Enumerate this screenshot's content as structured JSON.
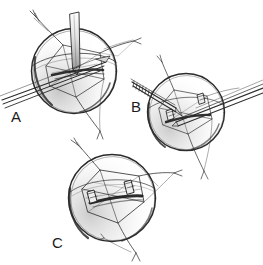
{
  "figure": {
    "kind": "ink-line-drawing",
    "background_color": "#ffffff",
    "ink_color": "#2b2b2b",
    "shade_color": "#8d8d8d",
    "width": 263,
    "height": 265,
    "panels": [
      {
        "id": "A",
        "label": "A",
        "label_x": 11,
        "label_y": 108,
        "sphere": {
          "cx": 74,
          "cy": 71,
          "r": 43
        },
        "caption_text": "A",
        "elements": [
          "sphere-outline",
          "inner-quadrilateral-suture-frame",
          "vertical-instrument",
          "diagonal-instrument-shaft",
          "suture-tail-upper-left",
          "suture-tail-upper-right",
          "suture-tail-lower"
        ]
      },
      {
        "id": "B",
        "label": "B",
        "label_x": 131,
        "label_y": 98,
        "sphere": {
          "cx": 186,
          "cy": 112,
          "r": 39
        },
        "caption_text": "B",
        "elements": [
          "sphere-outline",
          "inner-quadrilateral-suture-frame",
          "serrated-forceps-left",
          "tapered-forceps-right",
          "clip-left",
          "clip-right",
          "suture-tail-upper",
          "suture-tail-lower"
        ]
      },
      {
        "id": "C",
        "label": "C",
        "label_x": 52,
        "label_y": 234,
        "sphere": {
          "cx": 112,
          "cy": 198,
          "r": 44
        },
        "caption_text": "C",
        "elements": [
          "sphere-outline",
          "completed-rectangular-suture-frame",
          "clip-left",
          "clip-right",
          "suture-tail-upper-left",
          "suture-tail-right",
          "suture-tail-lower"
        ]
      }
    ]
  },
  "labels": {
    "a": "A",
    "b": "B",
    "c": "C"
  }
}
